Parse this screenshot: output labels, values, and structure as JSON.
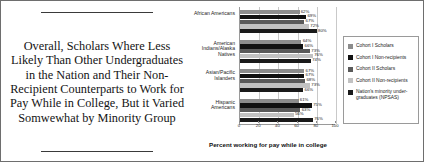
{
  "title": {
    "text": "Overall, Scholars Where Less Likely Than Other Undergraduates in the Nation and Their Non-Recipient Counterparts to Work for Pay While in College, But it Varied Somwewhat by Minority Group"
  },
  "chart_data": {
    "type": "bar",
    "orientation": "horizontal",
    "title": "",
    "xlabel": "Percent working for pay while in college",
    "ylabel": "",
    "xlim": [
      0,
      100
    ],
    "xticks": [
      0,
      20,
      40,
      60,
      80,
      100
    ],
    "grid": true,
    "legend_position": "right",
    "categories": [
      "African Americans",
      "American Indians/Alaska Natives",
      "Asian/Pacific Islanders",
      "Hispanic Americans"
    ],
    "series": [
      {
        "name": "Cohort I Scholars",
        "color": "#8c8c8c",
        "values": [
          62,
          64,
          67,
          61
        ],
        "labels": [
          "62%",
          "64%",
          "67%",
          "61%"
        ]
      },
      {
        "name": "Cohort I Non-recipients",
        "color": "#111111",
        "values": [
          69,
          66,
          67,
          75
        ],
        "labels": [
          "69%",
          "66%",
          "67%",
          "75%"
        ]
      },
      {
        "name": "Cohort II Scholars",
        "color": "#5a5a5a",
        "values": [
          67,
          73,
          68,
          63
        ],
        "labels": [
          "67%",
          "73%",
          "68%",
          "63%"
        ]
      },
      {
        "name": "Cohort II Non-recipients",
        "color": "#c2c2c2",
        "values": [
          72,
          76,
          73,
          56
        ],
        "labels": [
          "72%",
          "76%",
          "73%",
          "56%"
        ]
      },
      {
        "name": "Nation's minority under-graduates (NPSAS)",
        "color": "#1a1a1a",
        "values": [
          80,
          74,
          66,
          76
        ],
        "labels": [
          "80%",
          "74%",
          "66%",
          "76%"
        ]
      }
    ]
  },
  "legend": {
    "items": [
      {
        "label": "Cohort I Scholars",
        "color": "#8c8c8c"
      },
      {
        "label": "Cohort I Non-recipients",
        "color": "#111111"
      },
      {
        "label": "Cohort II Scholars",
        "color": "#5a5a5a"
      },
      {
        "label": "Cohort II Non-recipients",
        "color": "#c2c2c2"
      },
      {
        "label": "Nation's minority under-graduates (NPSAS)",
        "color": "#1a1a1a"
      }
    ]
  }
}
